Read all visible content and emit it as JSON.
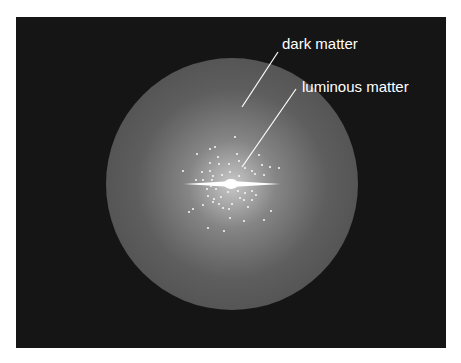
{
  "diagram": {
    "background": "#151515",
    "halo_color": "#5a5a5a",
    "labels": [
      {
        "id": "dark",
        "text": "dark matter",
        "x": 282,
        "y": 49
      },
      {
        "id": "luminous",
        "text": "luminous matter",
        "x": 302,
        "y": 92
      }
    ],
    "leaders": [
      {
        "x1": 278,
        "y1": 52,
        "x2": 242,
        "y2": 107
      },
      {
        "x1": 296,
        "y1": 89,
        "x2": 242,
        "y2": 167
      }
    ],
    "stars": [
      [
        235,
        137
      ],
      [
        197,
        154
      ],
      [
        210,
        149
      ],
      [
        215,
        147
      ],
      [
        218,
        157
      ],
      [
        237,
        154
      ],
      [
        259,
        155
      ],
      [
        183,
        171
      ],
      [
        210,
        163
      ],
      [
        219,
        164
      ],
      [
        229,
        164
      ],
      [
        239,
        161
      ],
      [
        230,
        172
      ],
      [
        210,
        171
      ],
      [
        202,
        172
      ],
      [
        213,
        176
      ],
      [
        222,
        175
      ],
      [
        245,
        168
      ],
      [
        252,
        171
      ],
      [
        262,
        165
      ],
      [
        270,
        167
      ],
      [
        255,
        174
      ],
      [
        264,
        175
      ],
      [
        279,
        168
      ],
      [
        212,
        180
      ],
      [
        203,
        180
      ],
      [
        216,
        189
      ],
      [
        207,
        189
      ],
      [
        228,
        192
      ],
      [
        238,
        191
      ],
      [
        245,
        193
      ],
      [
        252,
        191
      ],
      [
        256,
        195
      ],
      [
        240,
        198
      ],
      [
        221,
        197
      ],
      [
        214,
        199
      ],
      [
        208,
        196
      ],
      [
        219,
        204
      ],
      [
        232,
        204
      ],
      [
        244,
        200
      ],
      [
        252,
        200
      ],
      [
        223,
        208
      ],
      [
        213,
        202
      ],
      [
        229,
        209
      ],
      [
        248,
        207
      ],
      [
        189,
        212
      ],
      [
        193,
        209
      ],
      [
        203,
        205
      ],
      [
        271,
        211
      ],
      [
        230,
        218
      ],
      [
        244,
        221
      ],
      [
        264,
        220
      ],
      [
        208,
        228
      ],
      [
        224,
        231
      ],
      [
        211,
        186
      ],
      [
        227,
        183
      ],
      [
        247,
        184
      ],
      [
        196,
        180
      ],
      [
        239,
        176
      ],
      [
        214,
        185
      ]
    ]
  }
}
